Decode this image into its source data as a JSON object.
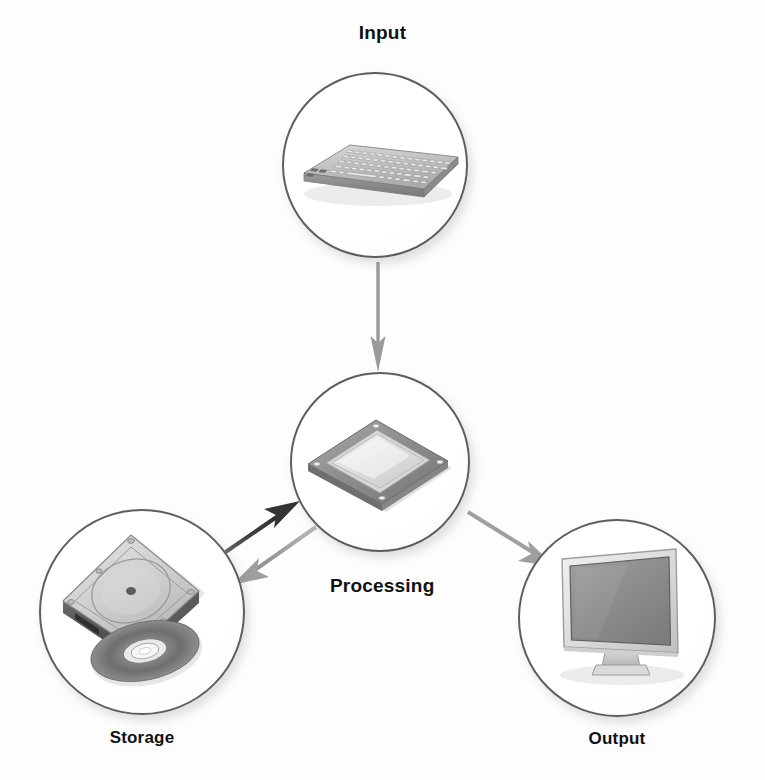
{
  "diagram": {
    "background_color": "#fdfdfd",
    "label_color": "#111111",
    "circle_outline_color": "#5e5e5e",
    "nodes": [
      {
        "id": "input",
        "label": "Input",
        "icon": "keyboard-icon",
        "cx": 375,
        "cy": 165,
        "r": 93,
        "label_x": 375,
        "label_y": 28,
        "label_size": 19
      },
      {
        "id": "processing",
        "label": "Processing",
        "icon": "cpu-chip-icon",
        "cx": 380,
        "cy": 462,
        "r": 90,
        "label_x": 382,
        "label_y": 575,
        "label_size": 19
      },
      {
        "id": "storage",
        "label": "Storage",
        "icon": "hard-disk-and-optical-disc-icon",
        "cx": 142,
        "cy": 612,
        "r": 103,
        "label_x": 142,
        "label_y": 728,
        "label_size": 17
      },
      {
        "id": "output",
        "label": "Output",
        "icon": "monitor-icon",
        "cx": 617,
        "cy": 618,
        "r": 99,
        "label_x": 640,
        "label_y": 730,
        "label_size": 17
      }
    ],
    "arrows": [
      {
        "id": "input-to-processing",
        "from": "input",
        "to": "processing",
        "direction": "down",
        "color": "#8e8e8e",
        "x1": 378,
        "y1": 262,
        "x2": 378,
        "y2": 368
      },
      {
        "id": "storage-to-processing",
        "from": "storage",
        "to": "processing",
        "direction": "up-right",
        "color": "#3f3f3f",
        "x1": 222,
        "y1": 556,
        "x2": 296,
        "y2": 505
      },
      {
        "id": "processing-to-storage",
        "from": "processing",
        "to": "storage",
        "direction": "down-left",
        "color": "#9a9a9a",
        "x1": 312,
        "y1": 528,
        "x2": 243,
        "y2": 580
      },
      {
        "id": "processing-to-output",
        "from": "processing",
        "to": "output",
        "direction": "down-right",
        "color": "#9a9a9a",
        "x1": 470,
        "y1": 513,
        "x2": 552,
        "y2": 562
      }
    ]
  }
}
